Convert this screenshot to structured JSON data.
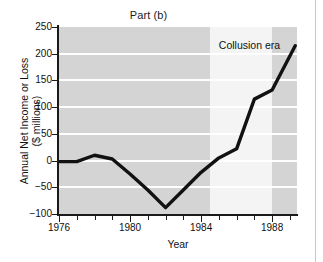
{
  "figure": {
    "title": "Part (b)",
    "background": "#ffffff",
    "plot_background": "#d4d4d4",
    "band_color": "#f4f4f4",
    "line_color": "#111111"
  },
  "annotations": [
    {
      "name": "collusion-era-label",
      "text": "Collusion era",
      "x": 1985.0,
      "y": 228
    }
  ],
  "chart_data": {
    "type": "line",
    "title": "Part (b)",
    "xlabel": "Year",
    "ylabel": "Annual Net Income or Loss ($ millions)",
    "ylabel_line1": "Annual Net Income or Loss",
    "ylabel_line2": "($ millions)",
    "xlim": [
      1976,
      1989.4
    ],
    "ylim": [
      -100,
      250
    ],
    "yticks": [
      -100,
      -50,
      0,
      50,
      100,
      150,
      200,
      250
    ],
    "ytick_labels": [
      "−100",
      "−50",
      "0",
      "50",
      "100",
      "150",
      "200",
      "250"
    ],
    "xticks": [
      1976,
      1980,
      1984,
      1988
    ],
    "xtick_labels": [
      "1976",
      "1980",
      "1984",
      "1988"
    ],
    "xminor_ticks": [
      1977,
      1978,
      1979,
      1981,
      1982,
      1983,
      1985,
      1986,
      1987,
      1989
    ],
    "grid": "horizontal-white",
    "legend": null,
    "shaded_regions": [
      {
        "label": "Collusion era",
        "x_start": 1984.5,
        "x_end": 1988.0,
        "color": "#f4f4f4"
      }
    ],
    "series": [
      {
        "name": "Annual net income or loss",
        "x": [
          1976,
          1977,
          1978,
          1979,
          1980,
          1981,
          1982,
          1983,
          1984,
          1985,
          1986,
          1987,
          1988,
          1989.3
        ],
        "values": [
          -2,
          -2,
          10,
          3,
          -25,
          -55,
          -88,
          -55,
          -22,
          5,
          22,
          115,
          132,
          215
        ]
      }
    ]
  }
}
